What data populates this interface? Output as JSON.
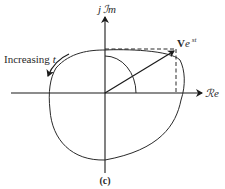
{
  "figure": {
    "caption": "(c)",
    "axes": {
      "real_label": "ℛe",
      "imag_label_prefix": "j",
      "imag_label": "ℐm"
    },
    "phasor": {
      "label_base": "V",
      "label_e": "e",
      "label_exp": "st"
    },
    "rotation_label": {
      "text": "Increasing",
      "var": "t"
    },
    "colors": {
      "stroke": "#1a1a1a",
      "text": "#2a2a2a"
    }
  }
}
